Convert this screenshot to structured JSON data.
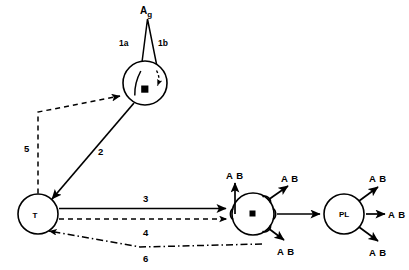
{
  "diagram": {
    "background_color": "#ffffff",
    "stroke_color": "#000000",
    "width": 409,
    "height": 270
  },
  "antigen": {
    "label_main": "A",
    "label_sub": "g",
    "full_label": "Ag"
  },
  "cells": {
    "macrophage": {
      "label": "M",
      "name": "macrophage"
    },
    "t_cell": {
      "label": "T",
      "name": "t-lymphocyte"
    },
    "b_cell": {
      "label": "B",
      "name": "b-lymphocyte"
    },
    "plasma_cell": {
      "label": "PL",
      "name": "plasma-cell"
    }
  },
  "pathway_labels": {
    "p1a": "1a",
    "p1b": "1b",
    "p2": "2",
    "p3": "3",
    "p4": "4",
    "p5": "5",
    "p6": "6"
  },
  "antibodies": {
    "b_cell_top": "A B",
    "b_cell_upper_right": "A B",
    "b_cell_lower_right": "A B",
    "plasma_upper": "A B",
    "plasma_middle": "A B",
    "plasma_lower": "A B"
  },
  "line_styles": {
    "solid": "solid",
    "dashed": "dashed",
    "dash_dot": "dash-dot"
  }
}
